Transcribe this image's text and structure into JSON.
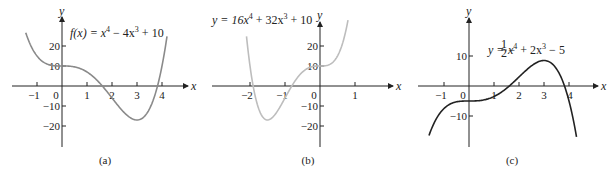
{
  "chart_data": [
    {
      "type": "line",
      "panel_label": "(a)",
      "equation_text": "f(x) = x⁴ − 4x³ + 10",
      "xlabel": "x",
      "ylabel": "y",
      "xticks": [
        -1,
        0,
        1,
        2,
        3,
        4
      ],
      "yticks": [
        -20,
        -10,
        10,
        20
      ],
      "xlim": [
        -1.45,
        4.2
      ],
      "ylim": [
        -30,
        30
      ],
      "curve_color": "#8a8a8a",
      "x": [
        -1.45,
        -1,
        0,
        1,
        2,
        3,
        4,
        4.2
      ],
      "y": [
        28.3,
        15,
        10,
        7,
        -6,
        -17,
        10,
        24.8
      ]
    },
    {
      "type": "line",
      "panel_label": "(b)",
      "equation_text": "y = 16x⁴ + 32x³ + 10",
      "xlabel": "x",
      "ylabel": "y",
      "xticks": [
        -2,
        -1,
        0,
        1
      ],
      "yticks": [
        -20,
        -10,
        10,
        20
      ],
      "xlim": [
        -2.1,
        0.8
      ],
      "ylim": [
        -30,
        30
      ],
      "curve_color": "#bdbdbd",
      "x": [
        -2.1,
        -2,
        -1.5,
        -1,
        0,
        0.8
      ],
      "y": [
        24.8,
        10,
        -17,
        -6,
        10,
        32.9
      ]
    },
    {
      "type": "line",
      "panel_label": "(c)",
      "equation_text": "y = −½x⁴ + 2x³ − 5",
      "xlabel": "x",
      "ylabel": "y",
      "xticks": [
        -1,
        0,
        1,
        2,
        3,
        4
      ],
      "yticks": [
        -10,
        10
      ],
      "xlim": [
        -1.6,
        4.3
      ],
      "ylim": [
        -20,
        22
      ],
      "curve_color": "#222222",
      "x": [
        -1.6,
        -1,
        0,
        1,
        2,
        3,
        4,
        4.3
      ],
      "y": [
        -16.5,
        -7.5,
        -5,
        -3.5,
        3,
        8.5,
        -5,
        -16.9
      ]
    }
  ],
  "panels": {
    "a": {
      "caption": "(a)",
      "equation_lhs": "f(x) = x",
      "equation_rest": " − 4x",
      "equation_tail": " + 10",
      "x_name": "x",
      "y_name": "y",
      "xtick_labels": [
        "−1",
        "0",
        "1",
        "2",
        "3",
        "4"
      ],
      "ytick_labels": [
        "20",
        "10",
        "−10",
        "−20"
      ]
    },
    "b": {
      "caption": "(b)",
      "equation_lhs": "y = 16x",
      "equation_rest": " + 32x",
      "equation_tail": " + 10",
      "x_name": "x",
      "y_name": "y",
      "xtick_labels": [
        "−2",
        "−1",
        "0",
        "1"
      ],
      "ytick_labels": [
        "20",
        "10",
        "−10",
        "−20"
      ]
    },
    "c": {
      "caption": "(c)",
      "equation_lhs": "y = −",
      "equation_frac_num": "1",
      "equation_frac_den": "2",
      "equation_mid": "x",
      "equation_rest": " + 2x",
      "equation_tail": " − 5",
      "x_name": "x",
      "y_name": "y",
      "xtick_labels": [
        "−1",
        "0",
        "1",
        "2",
        "3",
        "4"
      ],
      "ytick_labels": [
        "10",
        "−10"
      ]
    }
  }
}
